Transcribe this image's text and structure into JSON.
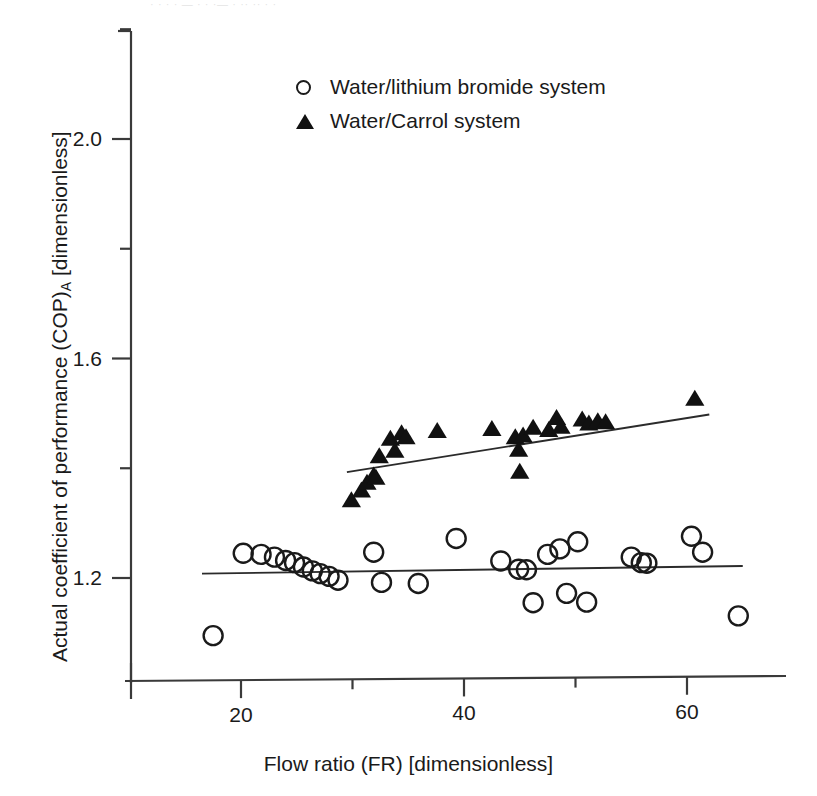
{
  "figure": {
    "top_cropped_text": "· · · · — · · ·— · ·· ·· · ·",
    "background_color": "#ffffff",
    "axis_color": "#3a3a3a",
    "marker_color": "#111111"
  },
  "legend": {
    "position": "inside-top-center",
    "items": [
      {
        "symbol": "open-circle",
        "label": "Water/lithium bromide system"
      },
      {
        "symbol": "filled-triangle",
        "label": "Water/Carrol system"
      }
    ]
  },
  "axes": {
    "x": {
      "title_text": "Flow ratio (FR) [dimensionless]",
      "tick_labels": [
        "20",
        "40",
        "60"
      ],
      "tick_values": [
        20,
        40,
        60
      ],
      "minor_tick_values": [
        30,
        50
      ],
      "range": [
        10,
        69
      ]
    },
    "y": {
      "title_main": "Actual coefficient of performance (COP)",
      "title_subscript": "A",
      "title_unit": " [dimensionless]",
      "tick_labels": [
        "2.0",
        "1.6",
        "1.2"
      ],
      "tick_values": [
        2.0,
        1.6,
        1.2
      ],
      "minor_tick_values": [
        2.2,
        1.8,
        1.4
      ],
      "range": [
        1.05,
        2.2
      ]
    }
  },
  "chart_data": {
    "type": "scatter",
    "title": "",
    "xlabel": "Flow ratio (FR) [dimensionless]",
    "ylabel": "Actual coefficient of performance (COP)_A [dimensionless]",
    "xlim": [
      10,
      69
    ],
    "ylim": [
      1.05,
      2.2
    ],
    "grid": false,
    "legend_position": "upper center inside",
    "series": [
      {
        "name": "Water/lithium bromide system",
        "marker": "open-circle",
        "points": [
          [
            17.5,
            1.095
          ],
          [
            20.2,
            1.245
          ],
          [
            21.8,
            1.243
          ],
          [
            23.0,
            1.238
          ],
          [
            24.0,
            1.232
          ],
          [
            24.8,
            1.228
          ],
          [
            25.6,
            1.22
          ],
          [
            26.4,
            1.213
          ],
          [
            27.1,
            1.208
          ],
          [
            27.9,
            1.203
          ],
          [
            28.7,
            1.196
          ],
          [
            31.9,
            1.247
          ],
          [
            32.6,
            1.192
          ],
          [
            35.9,
            1.19
          ],
          [
            39.3,
            1.272
          ],
          [
            43.3,
            1.231
          ],
          [
            44.9,
            1.216
          ],
          [
            45.6,
            1.215
          ],
          [
            46.2,
            1.155
          ],
          [
            47.5,
            1.243
          ],
          [
            48.6,
            1.253
          ],
          [
            49.2,
            1.172
          ],
          [
            50.2,
            1.266
          ],
          [
            51.0,
            1.156
          ],
          [
            55.0,
            1.238
          ],
          [
            55.9,
            1.228
          ],
          [
            56.4,
            1.227
          ],
          [
            60.4,
            1.276
          ],
          [
            61.4,
            1.247
          ],
          [
            64.6,
            1.131
          ]
        ],
        "trend_line": {
          "x1": 16.5,
          "y1": 1.208,
          "x2": 65.0,
          "y2": 1.222
        }
      },
      {
        "name": "Water/Carrol system",
        "marker": "filled-triangle",
        "points": [
          [
            29.9,
            1.34
          ],
          [
            30.8,
            1.358
          ],
          [
            31.3,
            1.372
          ],
          [
            31.9,
            1.385
          ],
          [
            32.1,
            1.381
          ],
          [
            32.4,
            1.42
          ],
          [
            33.4,
            1.452
          ],
          [
            33.8,
            1.43
          ],
          [
            34.4,
            1.462
          ],
          [
            34.8,
            1.455
          ],
          [
            37.6,
            1.466
          ],
          [
            42.5,
            1.47
          ],
          [
            44.6,
            1.455
          ],
          [
            44.9,
            1.432
          ],
          [
            45.0,
            1.392
          ],
          [
            45.3,
            1.458
          ],
          [
            46.2,
            1.472
          ],
          [
            47.6,
            1.468
          ],
          [
            48.3,
            1.49
          ],
          [
            48.7,
            1.474
          ],
          [
            50.6,
            1.487
          ],
          [
            51.2,
            1.48
          ],
          [
            52.0,
            1.484
          ],
          [
            52.7,
            1.482
          ],
          [
            60.7,
            1.525
          ]
        ],
        "trend_line": {
          "x1": 29.5,
          "y1": 1.393,
          "x2": 62.0,
          "y2": 1.498
        }
      }
    ]
  }
}
